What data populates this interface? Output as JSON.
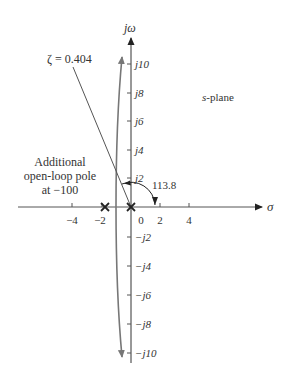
{
  "diagram": {
    "type": "root-locus",
    "plane_label": "s-plane",
    "plane_label_prefix": "s",
    "plane_label_suffix": "-plane",
    "axes": {
      "x_label": "σ",
      "y_label": "jω"
    },
    "x_ticks": [
      {
        "value": -4,
        "label": "−4"
      },
      {
        "value": -2,
        "label": "−2"
      },
      {
        "value": 0,
        "label": "0"
      },
      {
        "value": 2,
        "label": "2"
      },
      {
        "value": 4,
        "label": "4"
      }
    ],
    "y_ticks": [
      {
        "value": 10,
        "label": "j10"
      },
      {
        "value": 8,
        "label": "j8"
      },
      {
        "value": 6,
        "label": "j6"
      },
      {
        "value": 4,
        "label": "j4"
      },
      {
        "value": 2,
        "label": "j2"
      },
      {
        "value": -2,
        "label": "−j2"
      },
      {
        "value": -4,
        "label": "−j4"
      },
      {
        "value": -6,
        "label": "−j6"
      },
      {
        "value": -8,
        "label": "−j8"
      },
      {
        "value": -10,
        "label": "−j10"
      }
    ],
    "damping_line_label": "ζ = 0.404",
    "angle_label": "113.8",
    "annotation": {
      "line1": "Additional",
      "line2": "open-loop pole",
      "line3": "at −100"
    },
    "poles": [
      {
        "sigma": 0,
        "omega": 0
      },
      {
        "sigma": -1.8,
        "omega": 0
      }
    ],
    "colors": {
      "axis": "#333333",
      "locus": "#777777",
      "text": "#333333"
    }
  }
}
